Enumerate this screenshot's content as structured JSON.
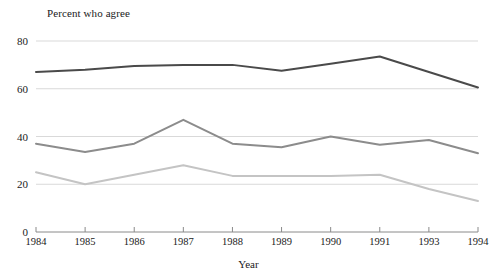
{
  "chart_data": {
    "type": "line",
    "title": "Percent who agree",
    "xlabel": "Year",
    "ylabel": "",
    "categories": [
      "1984",
      "1985",
      "1986",
      "1987",
      "1988",
      "1989",
      "1990",
      "1991",
      "1993",
      "1994"
    ],
    "yticks": [
      0,
      20,
      40,
      60,
      80
    ],
    "ylim": [
      0,
      80
    ],
    "grid": true,
    "legend": "none",
    "series": [
      {
        "name": "series-top",
        "color": "#4a4a4a",
        "values": [
          67,
          68,
          69.5,
          70,
          70,
          67.5,
          70.5,
          73.5,
          67,
          60.5
        ]
      },
      {
        "name": "series-middle",
        "color": "#8c8c8c",
        "values": [
          37,
          33.5,
          37,
          47,
          37,
          35.5,
          40,
          36.5,
          38.5,
          33
        ]
      },
      {
        "name": "series-bottom",
        "color": "#c4c4c4",
        "values": [
          25,
          20,
          24,
          28,
          23.5,
          23.5,
          23.5,
          24,
          18,
          13
        ]
      }
    ],
    "gridline_color": "#d9d9d9",
    "axis_color": "#8a8a8a"
  }
}
